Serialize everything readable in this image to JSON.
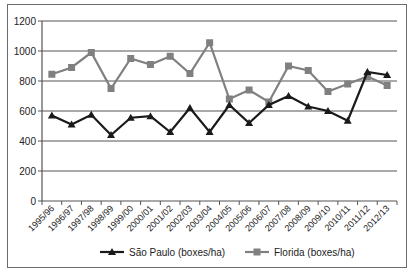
{
  "chart_data": {
    "type": "line",
    "title": "",
    "xlabel": "",
    "ylabel": "",
    "ylim": [
      0,
      1200
    ],
    "yticks": [
      0,
      200,
      400,
      600,
      800,
      1000,
      1200
    ],
    "grid": true,
    "legend_position": "bottom",
    "categories": [
      "1995/96",
      "1996/97",
      "1997/98",
      "1998/99",
      "1999/00",
      "2000/01",
      "2001/02",
      "2002/03",
      "2003/04",
      "2004/05",
      "2005/06",
      "2006/07",
      "2007/08",
      "2008/09",
      "2009/10",
      "2010/11",
      "2011/12",
      "2012/13"
    ],
    "series": [
      {
        "name": "São Paulo (boxes/ha)",
        "marker": "triangle",
        "color": "#1a1a1a",
        "values": [
          570,
          510,
          575,
          440,
          555,
          565,
          460,
          620,
          460,
          640,
          520,
          640,
          700,
          630,
          600,
          535,
          860,
          840
        ]
      },
      {
        "name": "Florida (boxes/ha)",
        "marker": "square",
        "color": "#808080",
        "values": [
          845,
          890,
          990,
          750,
          950,
          910,
          965,
          850,
          1055,
          680,
          740,
          660,
          900,
          870,
          730,
          780,
          830,
          770
        ]
      }
    ]
  }
}
